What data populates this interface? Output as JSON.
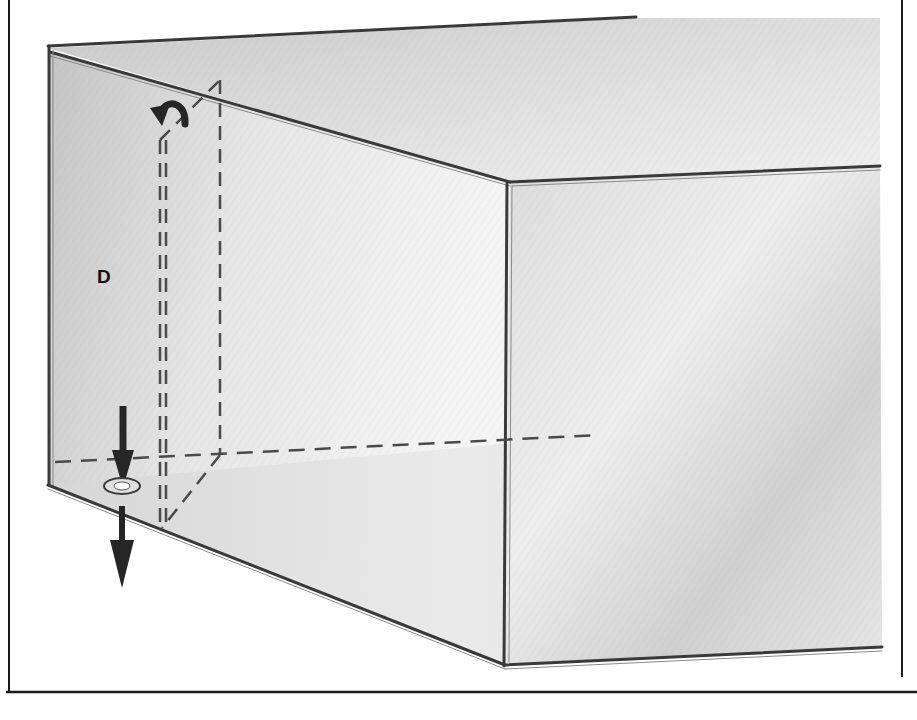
{
  "figure": {
    "labels": {
      "panel_label": "D"
    },
    "icons": {
      "rotate_arrow": "curved-rotation-arrow-icon",
      "push_down_arrow": "down-arrow-icon",
      "pull_down_arrow": "down-arrow-icon",
      "fastener": "screw-hole-icon"
    },
    "colors": {
      "background": "#ffffff",
      "frame": "#1a1a1a",
      "edge": "#3a3a3a",
      "shade_dark": "#b8b8b8",
      "shade_mid": "#d2d2d2",
      "shade_light": "#ebebeb",
      "arrow": "#262626"
    }
  }
}
